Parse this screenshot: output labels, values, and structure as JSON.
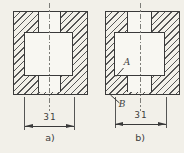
{
  "figure": {
    "type": "technical-section-views",
    "drawings": [
      {
        "label": "a)",
        "dimension": "31"
      },
      {
        "label": "b)",
        "dimension": "31",
        "annotations": [
          {
            "text": "A"
          },
          {
            "text": "B"
          }
        ]
      }
    ]
  },
  "colors": {
    "background": "#f2f0e9",
    "ink": "#3a3a3a",
    "hatch": "#565656",
    "paper": "#f8f7f2",
    "cline": "#7d7d78",
    "text": "#3c3c3c"
  }
}
